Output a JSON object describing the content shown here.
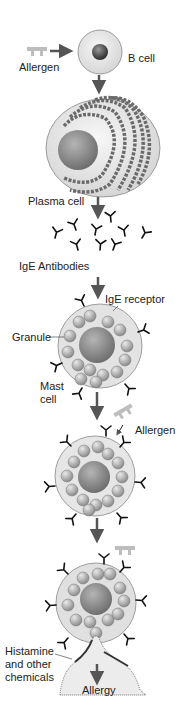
{
  "colors": {
    "allergen": "#b8b8b8",
    "arrow": "#555555",
    "cell_fill": "#e8e8e8",
    "nucleus": "#8a8a8a",
    "granule": "#a9a9a9",
    "antibody": "#111111"
  },
  "labels": {
    "allergen_1": "Allergen",
    "b_cell": "B cell",
    "plasma_cell": "Plasma cell",
    "ige_antibodies": "IgE Antibodies",
    "ige_receptor": "IgE receptor",
    "granule": "Granule",
    "mast_cell_line1": "Mast",
    "mast_cell_line2": "cell",
    "allergen_2": "Allergen",
    "histamine_line1": "Histamine",
    "histamine_line2": "and other",
    "histamine_line3": "chemicals",
    "allergy": "Allergy"
  },
  "stages": [
    {
      "name": "B cell activation by allergen"
    },
    {
      "name": "Plasma cell produces IgE antibodies"
    },
    {
      "name": "IgE binds receptors on mast cell"
    },
    {
      "name": "Allergen binds IgE on mast cell"
    },
    {
      "name": "Mast cell degranulates releasing histamine"
    },
    {
      "name": "Allergy"
    }
  ]
}
